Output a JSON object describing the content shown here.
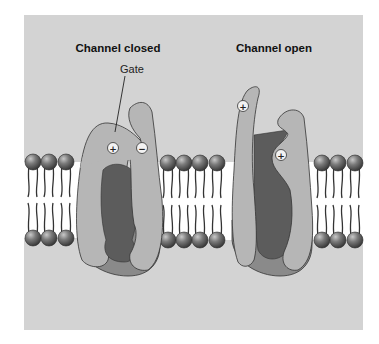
{
  "figure": {
    "titles": {
      "closed": "Channel closed",
      "open": "Channel open"
    },
    "labels": {
      "gate": "Gate"
    },
    "charges": {
      "closed_positive": "+",
      "closed_negative": "−",
      "open_positive_top": "+",
      "open_positive_inner": "+"
    },
    "colors": {
      "panel_background": "#d3d3d3",
      "protein_subunit": "#b6b6b6",
      "pore": "#5c5c5c",
      "protein_base": "#8a8a8a",
      "membrane_interior": "#ffffff",
      "lipid_head": "#6e6e6e",
      "outline": "#333333"
    }
  }
}
